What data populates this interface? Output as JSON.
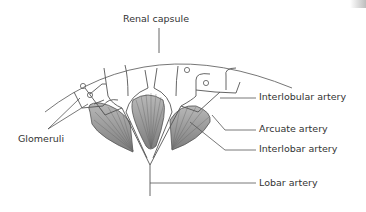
{
  "diagram": {
    "labels": {
      "renal_capsule": "Renal capsule",
      "interlobular_artery": "Interlobular artery",
      "glomeruli": "Glomeruli",
      "arcuate_artery": "Arcuate artery",
      "interlobar_artery": "Interlobar artery",
      "lobar_artery": "Lobar artery"
    },
    "colors": {
      "line": "#555555",
      "pyramid_fill": "#9a9a9a",
      "pyramid_stripe": "#6e6e6e",
      "capsule": "#777777",
      "text": "#333333"
    }
  }
}
